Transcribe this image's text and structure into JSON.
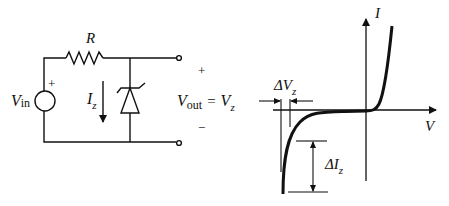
{
  "circuit": {
    "resistor_label": "R",
    "source_label_main": "V",
    "source_label_sub": "in",
    "source_polarity": "+",
    "current_label_main": "I",
    "current_label_sub": "z",
    "output_plus": "+",
    "output_minus": "−",
    "vout_main": "V",
    "vout_sub": "out",
    "vout_equals": "=",
    "vz_main": "V",
    "vz_sub": "z"
  },
  "graph": {
    "y_axis_label": "I",
    "x_axis_label": "V",
    "delta_vz_prefix": "ΔV",
    "delta_vz_sub": "z",
    "delta_iz_prefix": "ΔI",
    "delta_iz_sub": "z"
  },
  "colors": {
    "ink": "#111111",
    "background": "#ffffff"
  }
}
